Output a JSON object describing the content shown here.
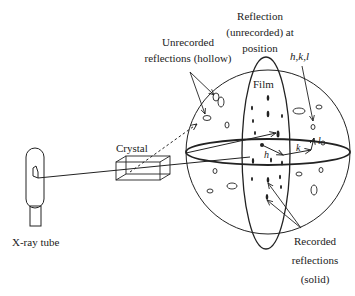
{
  "labels": {
    "unrecorded_line1": "Unrecorded",
    "unrecorded_line2": "reflections (hollow)",
    "reflection_line1": "Reflection",
    "reflection_line2": "(unrecorded) at",
    "reflection_line3": "position",
    "hkl": "h,k,l",
    "film": "Film",
    "crystal": "Crystal",
    "xray_tube": "X-ray tube",
    "recorded_line1": "Recorded",
    "recorded_line2": "reflections",
    "recorded_line3": "(solid)",
    "axis_h": "h",
    "axis_k": "k",
    "axis_l": "l"
  },
  "colors": {
    "stroke": "#222222",
    "background": "#ffffff"
  }
}
